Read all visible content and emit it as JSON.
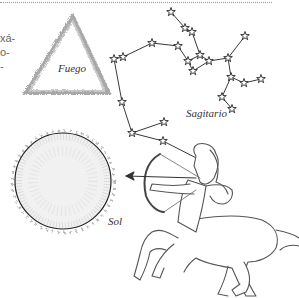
{
  "page": {
    "text_fragments": [
      "xá-",
      "o-",
      "-"
    ]
  },
  "illustrations": {
    "fire_triangle": {
      "label": "Fuego"
    },
    "constellation": {
      "label": "Sagitario"
    },
    "sun": {
      "label": "Sol"
    },
    "centaur": {
      "name": "archer centaur"
    }
  },
  "colors": {
    "ink": "#333333",
    "triangle": "#9a9a9a",
    "background": "#ffffff"
  }
}
